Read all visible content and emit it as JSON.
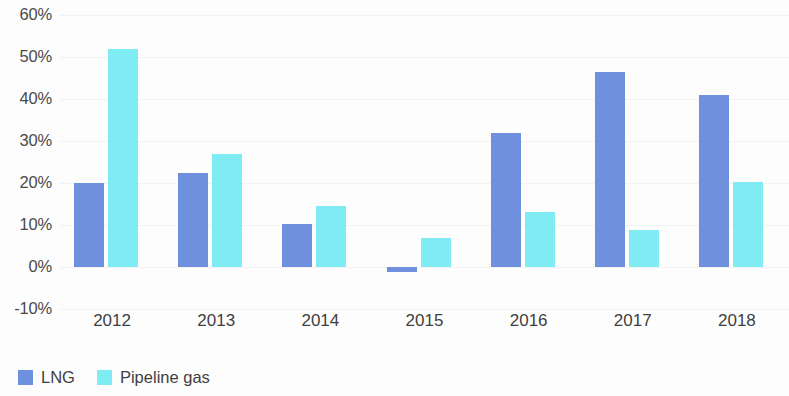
{
  "chart_data": {
    "type": "bar",
    "title": "",
    "subtitle": "",
    "xlabel": "",
    "ylabel": "",
    "categories": [
      "2012",
      "2013",
      "2014",
      "2015",
      "2016",
      "2017",
      "2018"
    ],
    "series": [
      {
        "name": "LNG",
        "color": "#6f90dd",
        "values": [
          20.0,
          22.5,
          10.3,
          -1.2,
          32.0,
          46.5,
          41.0
        ]
      },
      {
        "name": "Pipeline gas",
        "color": "#7eecf2",
        "values": [
          52.0,
          27.0,
          14.5,
          7.0,
          13.0,
          8.7,
          20.3
        ]
      }
    ],
    "ylim": [
      -10,
      60
    ],
    "y_ticks": [
      60,
      50,
      40,
      30,
      20,
      10,
      0,
      -10
    ],
    "y_tick_labels": [
      "60%",
      "50%",
      "40%",
      "30%",
      "20%",
      "10%",
      "0%",
      "-10%"
    ],
    "grid": true,
    "grid_color": "#f2f2f2",
    "legend_position": "bottom-left",
    "legend": [
      "LNG",
      "Pipeline gas"
    ],
    "value_suffix": "%"
  },
  "axis": {
    "y_tick_labels": [
      "60%",
      "50%",
      "40%",
      "30%",
      "20%",
      "10%",
      "0%",
      "-10%"
    ],
    "x_tick_labels": [
      "2012",
      "2013",
      "2014",
      "2015",
      "2016",
      "2017",
      "2018"
    ]
  },
  "legend": {
    "items": [
      {
        "label": "LNG",
        "color": "#6f90dd"
      },
      {
        "label": "Pipeline gas",
        "color": "#7eecf2"
      }
    ]
  }
}
